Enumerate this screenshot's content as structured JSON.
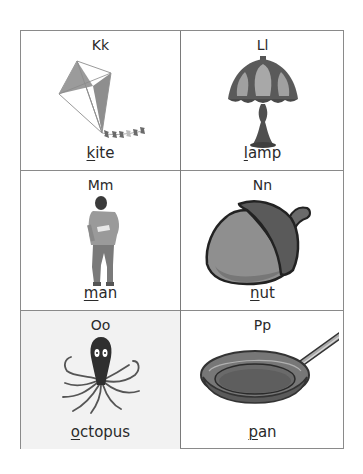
{
  "worksheet": {
    "cells": [
      {
        "letters": "Kk",
        "word_first": "k",
        "word_rest": "ite",
        "image": "kite-icon"
      },
      {
        "letters": "Ll",
        "word_first": "l",
        "word_rest": "amp",
        "image": "lamp-icon"
      },
      {
        "letters": "Mm",
        "word_first": "m",
        "word_rest": "an",
        "image": "man-icon"
      },
      {
        "letters": "Nn",
        "word_first": "n",
        "word_rest": "ut",
        "image": "acorn-nut-icon"
      },
      {
        "letters": "Oo",
        "word_first": "o",
        "word_rest": "ctopus",
        "image": "octopus-icon"
      },
      {
        "letters": "Pp",
        "word_first": "p",
        "word_rest": "an",
        "image": "frying-pan-icon"
      }
    ],
    "colors": {
      "border": "#8a8a8a",
      "highlighted_cell_bg": "#f2f2f2",
      "text": "#2a2a2a"
    }
  }
}
